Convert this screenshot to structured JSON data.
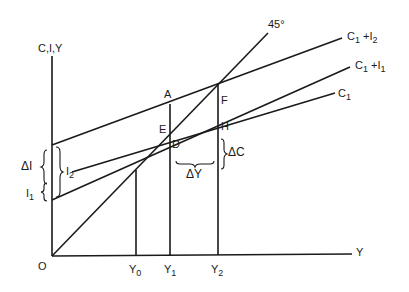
{
  "diagram": {
    "type": "keynesian-cross-multiplier",
    "axes": {
      "y_label": "C,I,Y",
      "x_label": "Y",
      "origin_label": "O"
    },
    "lines": [
      {
        "id": "c1-plus-i2",
        "label_main": "C",
        "label_sub1": "1",
        "label_plus": " +I",
        "label_sub2": "2"
      },
      {
        "id": "c1-plus-i1",
        "label_main": "C",
        "label_sub1": "1",
        "label_plus": " +I",
        "label_sub2": "1"
      },
      {
        "id": "c1",
        "label_main": "C",
        "label_sub1": "1"
      },
      {
        "id": "45-degree",
        "label": "45°"
      }
    ],
    "points": {
      "A": "A",
      "E": "E",
      "D": "D",
      "F": "F",
      "H": "H"
    },
    "x_ticks": [
      {
        "main": "Y",
        "sub": "0"
      },
      {
        "main": "Y",
        "sub": "1"
      },
      {
        "main": "Y",
        "sub": "2"
      }
    ],
    "annotations": {
      "delta_i": "ΔI",
      "i1_main": "I",
      "i1_sub": "1",
      "i2_main": "I",
      "i2_sub": "2",
      "delta_y": "ΔY",
      "delta_c": "ΔC"
    },
    "colors": {
      "ink": "#1a1a1a",
      "background": "#ffffff"
    }
  }
}
